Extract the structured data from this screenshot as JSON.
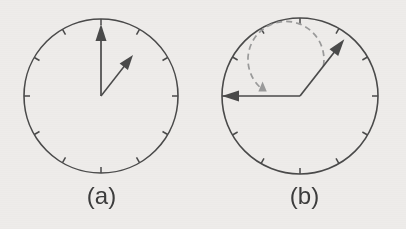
{
  "figure": {
    "background_color": "#eeecea",
    "line_color": "#4a4a4a",
    "dashed_color": "#9a9a9a",
    "label_color": "#3c3c3c"
  },
  "panels": [
    {
      "id": "a",
      "label": "(a)",
      "circle": {
        "cx": 101,
        "cy": 96,
        "r": 77,
        "tick_count": 12,
        "tick_length": 6
      },
      "vectors": [
        {
          "name": "vertical-up-arrow",
          "angle_deg_from_up": 0,
          "length": 72,
          "style": "solid",
          "head": "arrow"
        },
        {
          "name": "diagonal-up-right-arrow",
          "angle_deg_from_up": 38,
          "length": 52,
          "style": "solid",
          "head": "arrow"
        }
      ],
      "arc": null
    },
    {
      "id": "b",
      "label": "(b)",
      "circle": {
        "cx": 97,
        "cy": 96,
        "r": 78,
        "tick_count": 12,
        "tick_length": 6
      },
      "vectors": [
        {
          "name": "diagonal-up-right-arrow",
          "angle_deg_from_up": 38,
          "length": 72,
          "style": "solid",
          "head": "arrow"
        },
        {
          "name": "horizontal-left-arrow",
          "angle_deg_from_up": -90,
          "length": 78,
          "style": "solid",
          "head": "arrow"
        }
      ],
      "arc": {
        "name": "rotation-arc",
        "radius": 38,
        "start_deg_from_up": 38,
        "end_deg_from_up": -80,
        "direction": "counterclockwise",
        "style": "dashed",
        "head": "arrow"
      }
    }
  ]
}
